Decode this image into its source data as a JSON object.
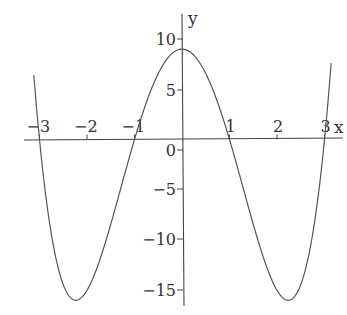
{
  "chart_data": {
    "type": "line",
    "title": "",
    "xlabel": "x",
    "ylabel": "y",
    "function": "y = x^4 - 10x^2 + 9",
    "x_ticks": [
      -3,
      -2,
      -1,
      1,
      2,
      3
    ],
    "x_tick_labels": [
      "−3",
      "−2",
      "−1",
      "1",
      "2",
      "3"
    ],
    "y_ticks": [
      10,
      5,
      0,
      -5,
      -10,
      -15
    ],
    "y_tick_labels": [
      "10",
      "5",
      "0",
      "−5",
      "−10",
      "−15"
    ],
    "xlim": [
      -3.15,
      3.45
    ],
    "ylim": [
      -16.5,
      12
    ],
    "grid": false,
    "legend": null,
    "series": [
      {
        "name": "curve",
        "color": "#555555",
        "x": [
          -3.05,
          -3,
          -2.75,
          -2.5,
          -2.236,
          -2,
          -1.75,
          -1.5,
          -1.25,
          -1,
          -0.75,
          -0.5,
          -0.25,
          0,
          0.25,
          0.5,
          0.75,
          1,
          1.25,
          1.5,
          1.75,
          2,
          2.236,
          2.5,
          2.75,
          3,
          3.05
        ],
        "y": [
          3.52,
          0,
          -9.45,
          -14.44,
          -16,
          -15,
          -12.24,
          -8.44,
          -4.18,
          0,
          4.69,
          6.56,
          8.38,
          9,
          8.38,
          6.56,
          4.69,
          0,
          -4.18,
          -8.44,
          -12.24,
          -15,
          -16,
          -14.44,
          -9.45,
          0,
          3.52
        ]
      }
    ],
    "key_points": {
      "roots": [
        -3,
        -1,
        1,
        3
      ],
      "local_max": [
        0,
        9
      ],
      "local_min": [
        [
          -2.236,
          -16
        ],
        [
          2.236,
          -16
        ]
      ]
    }
  }
}
